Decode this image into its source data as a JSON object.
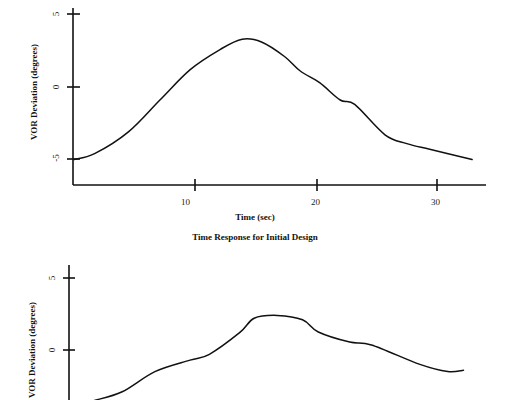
{
  "chart_data": [
    {
      "type": "line",
      "title": "Time Response for Initial Design",
      "xlabel": "Time (sec)",
      "ylabel": "VOR Deviation (degrees)",
      "xticks": [
        "10",
        "20",
        "30"
      ],
      "yticks": [
        "5",
        "0",
        "-5"
      ],
      "xlim": [
        0,
        34
      ],
      "ylim": [
        -6.8,
        5.5
      ],
      "grid": false,
      "series": [
        {
          "name": "VOR deviation",
          "x": [
            0,
            1.7,
            4.5,
            7.1,
            9.6,
            12.1,
            13.9,
            15.5,
            17.4,
            18.7,
            20.3,
            22.0,
            23.2,
            25.7,
            27.5,
            29.4,
            32.9
          ],
          "y": [
            -5.0,
            -4.6,
            -3.1,
            -0.9,
            1.2,
            2.6,
            3.3,
            3.1,
            2.1,
            1.1,
            0.3,
            -0.9,
            -1.2,
            -3.3,
            -3.9,
            -4.3,
            -5.0
          ]
        }
      ]
    },
    {
      "type": "line",
      "title": "",
      "xlabel": "",
      "ylabel": "VOR Deviation (degrees)",
      "yticks": [
        "5",
        "0"
      ],
      "xlim": [
        0,
        34
      ],
      "ylim": [
        -3.5,
        5.5
      ],
      "grid": false,
      "series": [
        {
          "name": "VOR deviation",
          "x": [
            2.1,
            4.4,
            7.1,
            10.0,
            11.6,
            14.1,
            15.3,
            17.2,
            19.3,
            20.6,
            23.2,
            25.0,
            29.0,
            31.3,
            32.6
          ],
          "y": [
            -3.5,
            -2.9,
            -1.5,
            -0.7,
            -0.3,
            1.2,
            2.2,
            2.4,
            2.1,
            1.25,
            0.55,
            0.35,
            -1.0,
            -1.5,
            -1.4
          ]
        }
      ]
    }
  ]
}
